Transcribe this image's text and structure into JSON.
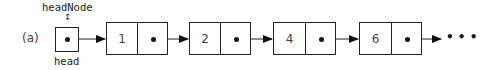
{
  "figure": {
    "label": "(a)",
    "head_pointer": {
      "name_above": "headNode",
      "name_below": "head",
      "link_symbol": "↕"
    },
    "nodes": [
      {
        "value": "1"
      },
      {
        "value": "2"
      },
      {
        "value": "4"
      },
      {
        "value": "6"
      }
    ],
    "continuation": "• • •"
  }
}
